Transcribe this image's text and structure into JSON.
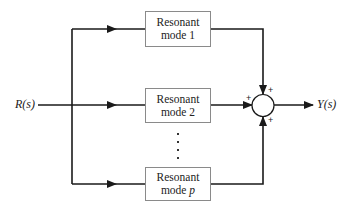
{
  "diagram": {
    "type": "block-diagram",
    "input": {
      "label": "R(s)"
    },
    "output": {
      "label": "Y(s)"
    },
    "blocks": [
      {
        "line1": "Resonant",
        "line2": "mode 1"
      },
      {
        "line1": "Resonant",
        "line2": "mode 2"
      },
      {
        "line1": "Resonant",
        "line2_prefix": "mode ",
        "line2_var": "p"
      }
    ],
    "ellipsis": "⋮",
    "summing_junction": {
      "signs": [
        "+",
        "+",
        "+"
      ]
    },
    "colors": {
      "line": "#1a1a1a",
      "block_border": "#8a8a8a",
      "background": "#ffffff"
    }
  }
}
